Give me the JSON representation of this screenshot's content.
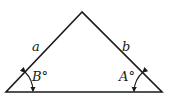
{
  "diagram": {
    "type": "triangle",
    "sides": {
      "left": "a",
      "right": "b"
    },
    "angles": {
      "left_base": "B°",
      "right_base": "A°"
    },
    "stroke_color": "#1a1a1a",
    "background": "#ffffff"
  }
}
